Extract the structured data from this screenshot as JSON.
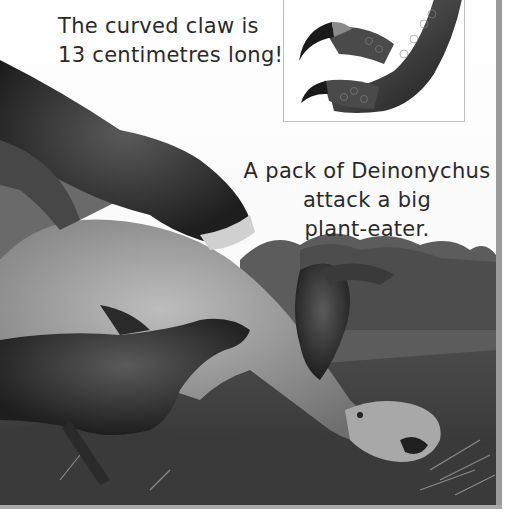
{
  "page": {
    "caption_claw": {
      "line1": "The curved claw is",
      "line2": "13 centimetres long!"
    },
    "caption_pack": {
      "line1": "A pack of Deinonychus",
      "line2": "attack a big",
      "line3": "plant-eater."
    },
    "images": {
      "claw_inset": "deinonychus-claw-illustration",
      "main_scene": "deinonychus-pack-attacking-plant-eater-illustration"
    }
  }
}
